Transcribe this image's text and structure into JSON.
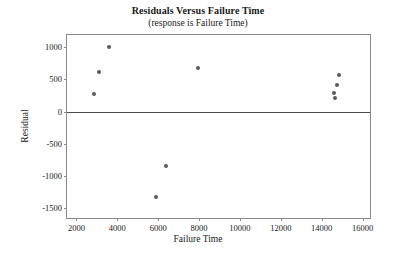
{
  "chart_data": {
    "type": "scatter",
    "title": "Residuals Versus Failure Time",
    "subtitle": "(response is Failure Time)",
    "xlabel": "Failure Time",
    "ylabel": "Residual",
    "xlim": [
      1535,
      16465
    ],
    "ylim": [
      -1680,
      1185
    ],
    "grid": false,
    "legend": null,
    "reference_line": {
      "axis": "y",
      "value": 0
    },
    "xticks": [
      2000,
      4000,
      6000,
      8000,
      10000,
      12000,
      14000,
      16000
    ],
    "xticklabels": [
      "2000",
      "4000",
      "6000",
      "8000",
      "10000",
      "12000",
      "14000",
      "16000"
    ],
    "yticks": [
      1000,
      500,
      0,
      -500,
      -1000,
      -1500
    ],
    "yticklabels": [
      "1000",
      "500",
      "0",
      "-500",
      "-1000",
      "-1500"
    ],
    "marker": {
      "shape": "circle",
      "color": "#5a5a5a",
      "size": 4
    },
    "points": [
      {
        "x": 2840,
        "y": 275
      },
      {
        "x": 3120,
        "y": 610
      },
      {
        "x": 3600,
        "y": 1000
      },
      {
        "x": 5870,
        "y": -1320
      },
      {
        "x": 6390,
        "y": -840
      },
      {
        "x": 7930,
        "y": 670
      },
      {
        "x": 14610,
        "y": 290
      },
      {
        "x": 14660,
        "y": 205
      },
      {
        "x": 14750,
        "y": 405
      },
      {
        "x": 14840,
        "y": 565
      }
    ]
  }
}
